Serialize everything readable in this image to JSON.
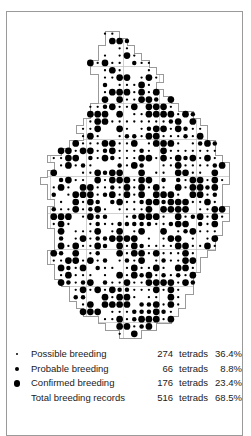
{
  "figure": {
    "type": "tetrad-distribution-map",
    "border_color": "#9a9a9a",
    "dot_color": "#000000"
  },
  "map": {
    "name": "breeding-distribution-map",
    "grid": {
      "tetrad_px": 7.32,
      "ten_km_px": 36.6,
      "origin_x": 6.5,
      "origin_y": 18.0,
      "cols": 32,
      "rows": 44
    },
    "boundary": "M 98,19 L 112,19 L 112,26 L 120,26 L 120,33 L 127,33 L 127,41 L 134,41 L 134,48 L 142,48 L 142,55 L 149,55 L 149,62 L 156,62 L 156,70 L 149,70 L 149,77 L 156,77 L 156,84 L 164,84 L 164,91 L 171,91 L 171,99 L 186,99 L 186,106 L 193,106 L 193,113 L 200,113 L 200,128 L 208,128 L 208,143 L 215,143 L 215,150 L 222,150 L 222,172 L 215,172 L 215,194 L 222,194 L 222,209 L 215,209 L 215,223 L 208,223 L 208,238 L 200,238 L 200,245 L 193,245 L 193,260 L 186,260 L 186,282 L 178,282 L 178,296 L 171,296 L 171,304 L 164,304 L 164,311 L 149,311 L 149,318 L 134,318 L 134,326 L 112,326 L 112,318 L 98,318 L 98,311 L 91,311 L 91,304 L 76,304 L 76,296 L 69,296 L 69,289 L 62,289 L 62,274 L 54,274 L 54,267 L 47,267 L 47,252 L 40,252 L 40,238 L 47,238 L 47,216 L 40,216 L 40,194 L 47,194 L 47,187 L 40,187 L 40,172 L 33,172 L 33,165 L 40,165 L 40,158 L 47,158 L 47,150 L 40,150 L 40,143 L 54,143 L 54,136 L 62,136 L 62,128 L 76,128 L 76,121 L 69,121 L 69,113 L 76,113 L 76,106 L 83,106 L 83,91 L 91,91 L 91,62 L 83,62 L 83,48 L 91,48 L 91,33 L 98,33 Z"
  },
  "legend": {
    "name": "map-legend",
    "unit": "tetrads",
    "rows": [
      {
        "symbol": "possible",
        "label": "Possible breeding",
        "count": "274",
        "unit": "tetrads",
        "percent": "36.4%"
      },
      {
        "symbol": "probable",
        "label": "Probable breeding",
        "count": "66",
        "unit": "tetrads",
        "percent": "8.8%"
      },
      {
        "symbol": "confirmed",
        "label": "Confirmed breeding",
        "count": "176",
        "unit": "tetrads",
        "percent": "23.4%"
      },
      {
        "symbol": "none",
        "label": "Total breeding records",
        "count": "516",
        "unit": "tetrads",
        "percent": "68.5%"
      }
    ]
  },
  "chart_data": {
    "type": "map",
    "categories": [
      "Possible breeding",
      "Probable breeding",
      "Confirmed breeding",
      "Total breeding records"
    ],
    "values": [
      274,
      66,
      176,
      516
    ],
    "percentages": [
      36.4,
      8.8,
      23.4,
      68.5
    ],
    "unit": "tetrads",
    "symbol_sizes_px": {
      "possible": 2.2,
      "probable": 4.4,
      "confirmed": 6.6
    },
    "grid": "10 km squares subdivided into 2 km tetrads",
    "legend_position": "bottom"
  }
}
